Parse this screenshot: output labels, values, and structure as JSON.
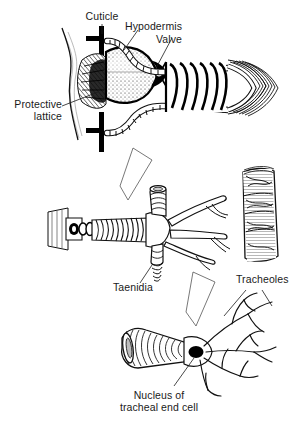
{
  "figure": {
    "title_visible": false,
    "background_color": "#ffffff",
    "ink_color": "#000000",
    "text_color": "#1a1a1a"
  },
  "labels": {
    "cuticle": "Cuticle",
    "hypodermis": "Hypodermis",
    "valve": "Valve",
    "protective_lattice_line1": "Protective",
    "protective_lattice_line2": "lattice",
    "taenidia": "Taenidia",
    "tracheoles": "Tracheoles",
    "nucleus_line1": "Nucleus of",
    "nucleus_line2": "tracheal end cell"
  },
  "panels": {
    "top": "spiracle-and-valve",
    "middle": "branching-trachea-and-muscle",
    "bottom": "tracheal-end-cell"
  }
}
